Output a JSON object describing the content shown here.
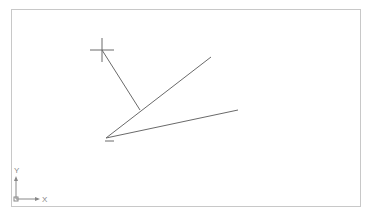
{
  "viewport": {
    "background": "#ffffff",
    "border_color": "#c8c8c8"
  },
  "drawing": {
    "line_color": "#6a6a6a",
    "vertex": {
      "x": 106,
      "y": 138
    },
    "line_upper_end": {
      "x": 211,
      "y": 57
    },
    "line_lower_end": {
      "x": 238,
      "y": 110
    },
    "leader_start": {
      "x": 102,
      "y": 50
    },
    "leader_end": {
      "x": 140,
      "y": 110
    }
  },
  "cursor": {
    "icon": "crosshair-icon",
    "x": 102,
    "y": 50
  },
  "ucs_icon": {
    "x_label": "X",
    "y_label": "Y"
  }
}
